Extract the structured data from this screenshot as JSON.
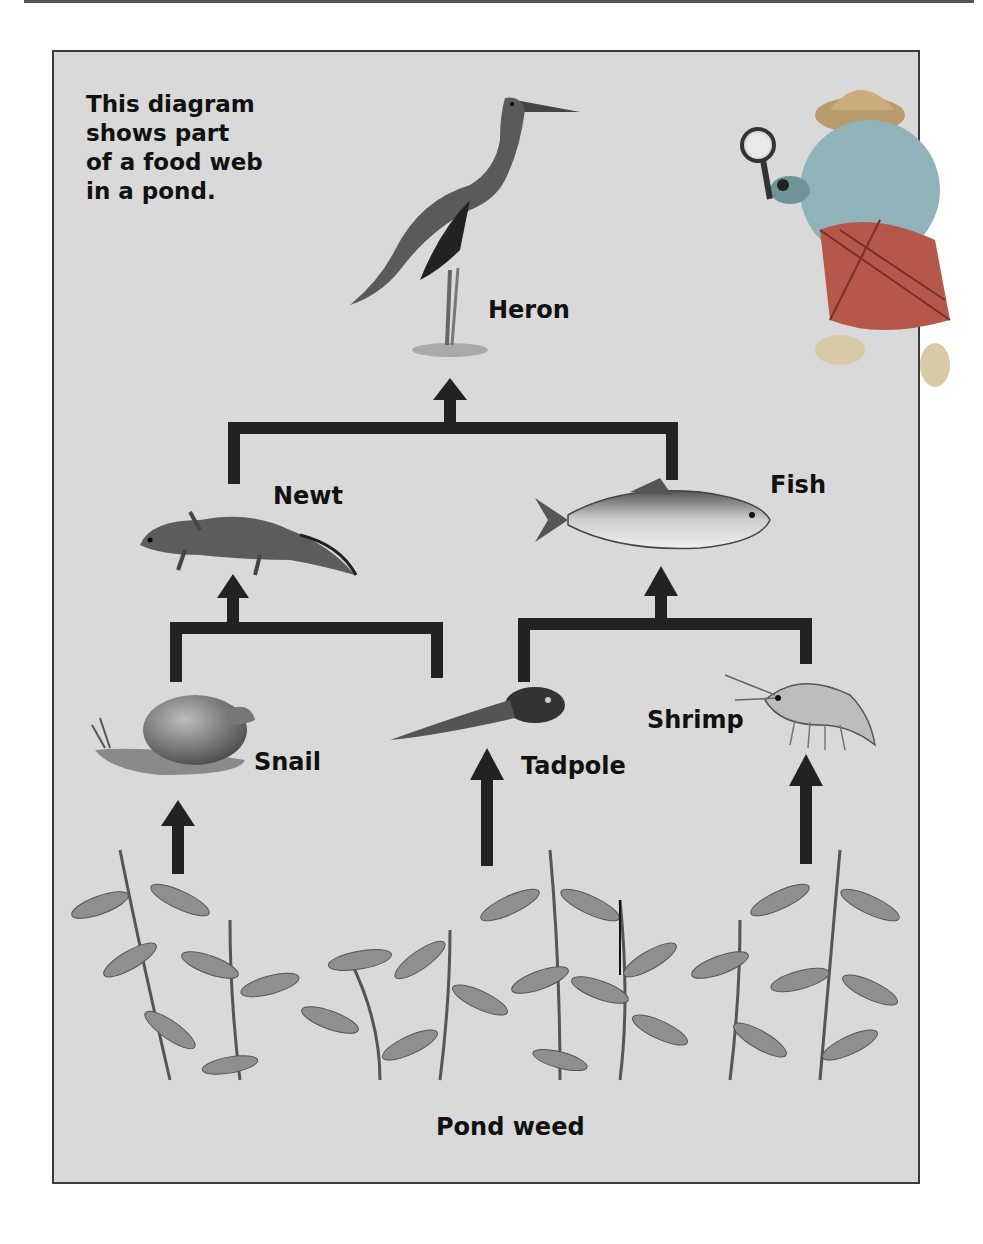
{
  "diagram": {
    "title_lines": [
      "This diagram",
      "shows part",
      "of a food web",
      "in a pond."
    ],
    "colors": {
      "background": "#d9d9d9",
      "border": "#3a3a3a",
      "arrow": "#222222",
      "text": "#111111"
    },
    "organisms": [
      {
        "id": "heron",
        "label": "Heron",
        "level": 3
      },
      {
        "id": "newt",
        "label": "Newt",
        "level": 2
      },
      {
        "id": "fish",
        "label": "Fish",
        "level": 2
      },
      {
        "id": "snail",
        "label": "Snail",
        "level": 1
      },
      {
        "id": "tadpole",
        "label": "Tadpole",
        "level": 1
      },
      {
        "id": "shrimp",
        "label": "Shrimp",
        "level": 1
      },
      {
        "id": "pond_weed",
        "label": "Pond weed",
        "level": 0
      }
    ],
    "edges": [
      {
        "from": "Newt",
        "to": "Heron"
      },
      {
        "from": "Fish",
        "to": "Heron"
      },
      {
        "from": "Snail",
        "to": "Newt"
      },
      {
        "from": "Tadpole",
        "to": "Newt"
      },
      {
        "from": "Tadpole",
        "to": "Fish"
      },
      {
        "from": "Shrimp",
        "to": "Fish"
      },
      {
        "from": "Pond weed",
        "to": "Snail"
      },
      {
        "from": "Pond weed",
        "to": "Tadpole"
      },
      {
        "from": "Pond weed",
        "to": "Shrimp"
      }
    ],
    "mascot": "detective-dog-with-magnifying-glass"
  }
}
